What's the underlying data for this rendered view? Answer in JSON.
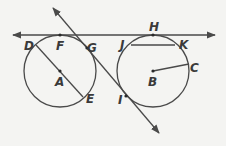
{
  "diagram": {
    "type": "geometry-circles",
    "colors": {
      "background": "#f4f4f2",
      "stroke": "#4a4a4a",
      "text": "#3a3a3a"
    },
    "circles": [
      {
        "name": "circle-A",
        "center_label": "A",
        "cx": 60,
        "cy": 71,
        "r": 36
      },
      {
        "name": "circle-B",
        "center_label": "B",
        "cx": 153,
        "cy": 71,
        "r": 36
      }
    ],
    "labels": {
      "A": "A",
      "B": "B",
      "C": "C",
      "D": "D",
      "E": "E",
      "F": "F",
      "G": "G",
      "H": "H",
      "I": "I",
      "J": "J",
      "K": "K"
    },
    "lines": {
      "tangent_line": {
        "description": "line through F and H tangent to both circles",
        "x1": 13,
        "y1": 35,
        "x2": 215,
        "y2": 35
      },
      "secant_line": {
        "description": "line through G and I",
        "x1": 53,
        "y1": 8,
        "x2": 159,
        "y2": 133
      },
      "diameter_DE": {
        "x1": 36,
        "y1": 45,
        "x2": 83,
        "y2": 97
      },
      "chord_JK": {
        "x1": 131,
        "y1": 45,
        "x2": 175,
        "y2": 45
      },
      "radius_BC": {
        "x1": 153,
        "y1": 71,
        "x2": 189,
        "y2": 64
      }
    }
  }
}
